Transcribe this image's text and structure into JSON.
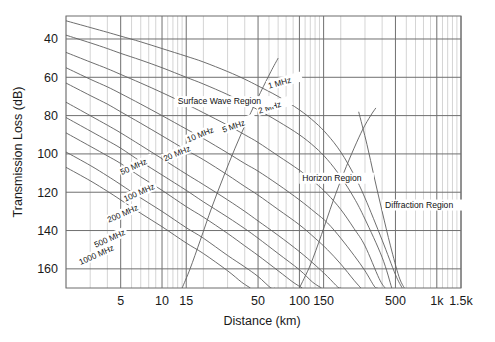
{
  "chart_data": {
    "type": "line",
    "title": "",
    "xlabel": "Distance (km)",
    "ylabel": "Transmission Loss (dB)",
    "xscale": "log",
    "yscale": "linear",
    "xlim": [
      2,
      1500
    ],
    "ylim": [
      170,
      28
    ],
    "grid": true,
    "legend_position": "inline-curve-labels",
    "xticks": [
      {
        "value": 5,
        "label": "5"
      },
      {
        "value": 10,
        "label": "10"
      },
      {
        "value": 15,
        "label": "15"
      },
      {
        "value": 50,
        "label": "50"
      },
      {
        "value": 100,
        "label": "100"
      },
      {
        "value": 150,
        "label": "150"
      },
      {
        "value": 500,
        "label": "500"
      },
      {
        "value": 1000,
        "label": "1k"
      },
      {
        "value": 1500,
        "label": "1.5k"
      }
    ],
    "yticks": [
      {
        "value": 40,
        "label": "40"
      },
      {
        "value": 60,
        "label": "60"
      },
      {
        "value": 80,
        "label": "80"
      },
      {
        "value": 100,
        "label": "100"
      },
      {
        "value": 120,
        "label": "120"
      },
      {
        "value": 140,
        "label": "140"
      },
      {
        "value": 160,
        "label": "160"
      }
    ],
    "xgridlines": [
      2,
      3,
      4,
      5,
      6,
      7,
      8,
      9,
      10,
      11,
      12,
      13,
      14,
      15,
      20,
      30,
      40,
      50,
      60,
      70,
      80,
      90,
      100,
      110,
      120,
      130,
      140,
      150,
      200,
      300,
      400,
      500,
      600,
      700,
      800,
      900,
      1000,
      1100,
      1200,
      1300,
      1400,
      1500
    ],
    "ygridlines": [
      40,
      60,
      80,
      100,
      120,
      140,
      160
    ],
    "annotations": [
      {
        "text": "Surface Wave Region",
        "x": 13,
        "y": 74
      },
      {
        "text": "Horizon Region",
        "x": 105,
        "y": 114
      },
      {
        "text": "Diffraction Region",
        "x": 420,
        "y": 128
      }
    ],
    "series": [
      {
        "name": "1 MHz",
        "label": "1 MHz",
        "label_x": 60,
        "label_y": 66,
        "label_rotation": -16,
        "points": [
          [
            2,
            30.5
          ],
          [
            3,
            34
          ],
          [
            4,
            36.5
          ],
          [
            5,
            38.5
          ],
          [
            7,
            41.5
          ],
          [
            10,
            45
          ],
          [
            15,
            49
          ],
          [
            20,
            52
          ],
          [
            30,
            57
          ],
          [
            40,
            61
          ],
          [
            50,
            64.5
          ],
          [
            70,
            70
          ],
          [
            100,
            77
          ],
          [
            130,
            83.5
          ],
          [
            160,
            90
          ],
          [
            200,
            99
          ],
          [
            250,
            111
          ],
          [
            300,
            123
          ],
          [
            400,
            145
          ],
          [
            500,
            163
          ],
          [
            560,
            172
          ]
        ]
      },
      {
        "name": "2 MHz",
        "label": "2 MHz",
        "label_x": 51,
        "label_y": 79,
        "label_rotation": -18,
        "points": [
          [
            2,
            38
          ],
          [
            3,
            42
          ],
          [
            4,
            45
          ],
          [
            5,
            47.5
          ],
          [
            7,
            51
          ],
          [
            10,
            55
          ],
          [
            15,
            60
          ],
          [
            20,
            63.5
          ],
          [
            30,
            69
          ],
          [
            40,
            73.5
          ],
          [
            50,
            77
          ],
          [
            70,
            83
          ],
          [
            100,
            90
          ],
          [
            130,
            96.5
          ],
          [
            160,
            103
          ],
          [
            200,
            112
          ],
          [
            250,
            123
          ],
          [
            300,
            134
          ],
          [
            400,
            154
          ],
          [
            470,
            170
          ]
        ]
      },
      {
        "name": "5 MHz",
        "label": "5 MHz",
        "label_x": 28,
        "label_y": 89,
        "label_rotation": -20,
        "points": [
          [
            2,
            47
          ],
          [
            3,
            52
          ],
          [
            4,
            55.5
          ],
          [
            5,
            58.5
          ],
          [
            7,
            63
          ],
          [
            10,
            68
          ],
          [
            15,
            74
          ],
          [
            20,
            78.5
          ],
          [
            30,
            85
          ],
          [
            40,
            90
          ],
          [
            50,
            94
          ],
          [
            70,
            101
          ],
          [
            100,
            108.5
          ],
          [
            130,
            115
          ],
          [
            160,
            121
          ],
          [
            200,
            129
          ],
          [
            250,
            139
          ],
          [
            300,
            148
          ],
          [
            380,
            165
          ],
          [
            420,
            172
          ]
        ]
      },
      {
        "name": "10 MHz",
        "label": "10 MHz",
        "label_x": 15.5,
        "label_y": 94,
        "label_rotation": -22,
        "points": [
          [
            2,
            55
          ],
          [
            3,
            61
          ],
          [
            4,
            65
          ],
          [
            5,
            68.5
          ],
          [
            7,
            74
          ],
          [
            10,
            80
          ],
          [
            15,
            87
          ],
          [
            20,
            92
          ],
          [
            30,
            99.5
          ],
          [
            40,
            105
          ],
          [
            50,
            109
          ],
          [
            70,
            116
          ],
          [
            100,
            124
          ],
          [
            130,
            130.5
          ],
          [
            160,
            136
          ],
          [
            200,
            144
          ],
          [
            250,
            153
          ],
          [
            300,
            161
          ],
          [
            350,
            169
          ],
          [
            370,
            172
          ]
        ]
      },
      {
        "name": "20 MHz",
        "label": "20 MHz",
        "label_x": 10.5,
        "label_y": 104,
        "label_rotation": -23,
        "points": [
          [
            2,
            63
          ],
          [
            3,
            69.5
          ],
          [
            4,
            74
          ],
          [
            5,
            78
          ],
          [
            7,
            84
          ],
          [
            10,
            90.5
          ],
          [
            15,
            98
          ],
          [
            20,
            103
          ],
          [
            30,
            111
          ],
          [
            40,
            117
          ],
          [
            50,
            121.5
          ],
          [
            70,
            129
          ],
          [
            100,
            137
          ],
          [
            130,
            144
          ],
          [
            160,
            150
          ],
          [
            200,
            157.5
          ],
          [
            250,
            166
          ],
          [
            280,
            171
          ]
        ]
      },
      {
        "name": "50 MHz",
        "label": "50 MHz",
        "label_x": 5.1,
        "label_y": 111,
        "label_rotation": -24,
        "points": [
          [
            2,
            73
          ],
          [
            3,
            80
          ],
          [
            4,
            85
          ],
          [
            5,
            89
          ],
          [
            7,
            95.5
          ],
          [
            10,
            102.5
          ],
          [
            15,
            110.5
          ],
          [
            20,
            116
          ],
          [
            30,
            124
          ],
          [
            40,
            130
          ],
          [
            50,
            135
          ],
          [
            70,
            142.5
          ],
          [
            100,
            151
          ],
          [
            130,
            158
          ],
          [
            160,
            164
          ],
          [
            190,
            169.5
          ],
          [
            200,
            171
          ]
        ]
      },
      {
        "name": "100 MHz",
        "label": "100 MHz",
        "label_x": 5.4,
        "label_y": 125,
        "label_rotation": -24,
        "points": [
          [
            2,
            81
          ],
          [
            3,
            88
          ],
          [
            4,
            93
          ],
          [
            5,
            97
          ],
          [
            7,
            104
          ],
          [
            10,
            111
          ],
          [
            15,
            119
          ],
          [
            20,
            125
          ],
          [
            30,
            133
          ],
          [
            40,
            139
          ],
          [
            50,
            144
          ],
          [
            70,
            152
          ],
          [
            100,
            160.5
          ],
          [
            125,
            167
          ],
          [
            145,
            171
          ]
        ]
      },
      {
        "name": "200 MHz",
        "label": "200 MHz",
        "label_x": 4.1,
        "label_y": 136,
        "label_rotation": -24,
        "points": [
          [
            2,
            89
          ],
          [
            3,
            96
          ],
          [
            4,
            101
          ],
          [
            5,
            105
          ],
          [
            7,
            112
          ],
          [
            10,
            119
          ],
          [
            15,
            127.5
          ],
          [
            20,
            133
          ],
          [
            30,
            141.5
          ],
          [
            40,
            148
          ],
          [
            50,
            153
          ],
          [
            70,
            161
          ],
          [
            90,
            167
          ],
          [
            105,
            171
          ]
        ]
      },
      {
        "name": "500 MHz",
        "label": "500 MHz",
        "label_x": 3.3,
        "label_y": 149,
        "label_rotation": -24,
        "points": [
          [
            2,
            99
          ],
          [
            3,
            106
          ],
          [
            4,
            111.5
          ],
          [
            5,
            116
          ],
          [
            7,
            123
          ],
          [
            10,
            130
          ],
          [
            15,
            138.5
          ],
          [
            20,
            144
          ],
          [
            30,
            153
          ],
          [
            40,
            159
          ],
          [
            50,
            164
          ],
          [
            62,
            170
          ],
          [
            66,
            172
          ]
        ]
      },
      {
        "name": "1000 MHz",
        "label": "1000 MHz",
        "label_x": 2.55,
        "label_y": 158,
        "label_rotation": -24,
        "points": [
          [
            2,
            107
          ],
          [
            3,
            114
          ],
          [
            4,
            119.5
          ],
          [
            5,
            124
          ],
          [
            7,
            131
          ],
          [
            10,
            138
          ],
          [
            15,
            146.5
          ],
          [
            20,
            152
          ],
          [
            30,
            161
          ],
          [
            38,
            167
          ],
          [
            44,
            172
          ]
        ]
      },
      {
        "name": "horizon-boundary-ascending",
        "label": "",
        "points": [
          [
            14,
            172
          ],
          [
            16,
            160
          ],
          [
            19,
            145
          ],
          [
            23,
            128
          ],
          [
            28,
            112
          ],
          [
            34,
            97
          ],
          [
            42,
            82
          ],
          [
            52,
            68
          ],
          [
            62,
            57
          ],
          [
            70,
            50
          ]
        ]
      },
      {
        "name": "diffraction-boundary-ascending",
        "label": "",
        "points": [
          [
            100,
            172
          ],
          [
            120,
            158
          ],
          [
            145,
            142
          ],
          [
            175,
            125
          ],
          [
            210,
            110
          ],
          [
            250,
            97
          ],
          [
            290,
            87
          ],
          [
            330,
            80
          ],
          [
            360,
            76
          ]
        ]
      },
      {
        "name": "diffraction-boundary-descending",
        "label": "",
        "points": [
          [
            270,
            78
          ],
          [
            310,
            95
          ],
          [
            350,
            112
          ],
          [
            400,
            130
          ],
          [
            460,
            148
          ],
          [
            530,
            164
          ],
          [
            580,
            172
          ]
        ]
      }
    ]
  }
}
